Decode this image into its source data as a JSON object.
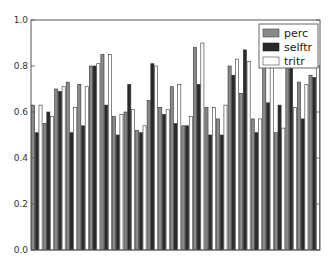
{
  "chart_data": {
    "type": "bar",
    "title": "",
    "xlabel": "",
    "ylabel": "",
    "ylim": [
      0.0,
      1.0
    ],
    "yticks": [
      "0.0",
      "0.2",
      "0.4",
      "0.6",
      "0.8",
      "1.0"
    ],
    "grid": false,
    "legend_position": "upper right",
    "categories": [
      "1",
      "2",
      "3",
      "4",
      "5",
      "6",
      "7",
      "8",
      "9",
      "10",
      "11",
      "12",
      "13",
      "14",
      "15",
      "16",
      "17",
      "18",
      "19",
      "20",
      "21",
      "22",
      "23",
      "24",
      "25"
    ],
    "series": [
      {
        "name": "perc",
        "color": "#8a8a8a",
        "values": [
          0.63,
          0.55,
          0.7,
          0.73,
          0.72,
          0.8,
          0.85,
          0.58,
          0.6,
          0.52,
          0.65,
          0.62,
          0.71,
          0.54,
          0.88,
          0.62,
          0.57,
          0.8,
          0.68,
          0.57,
          0.82,
          0.51,
          0.82,
          0.73,
          0.76
        ]
      },
      {
        "name": "selftr",
        "color": "#2a2a2a",
        "values": [
          0.51,
          0.6,
          0.69,
          0.51,
          0.54,
          0.8,
          0.63,
          0.5,
          0.72,
          0.51,
          0.81,
          0.59,
          0.55,
          0.54,
          0.72,
          0.5,
          0.5,
          0.76,
          0.87,
          0.51,
          0.64,
          0.63,
          0.85,
          0.57,
          0.75
        ]
      },
      {
        "name": "tritr",
        "color": "#ffffff",
        "values": [
          0.63,
          0.58,
          0.71,
          0.62,
          0.71,
          0.81,
          0.85,
          0.59,
          0.61,
          0.54,
          0.8,
          0.61,
          0.72,
          0.58,
          0.9,
          0.62,
          0.63,
          0.83,
          0.82,
          0.57,
          0.81,
          0.53,
          0.62,
          0.72,
          0.8
        ]
      }
    ]
  },
  "legend": {
    "items": [
      {
        "label": "perc"
      },
      {
        "label": "selftr"
      },
      {
        "label": "tritr"
      }
    ]
  }
}
